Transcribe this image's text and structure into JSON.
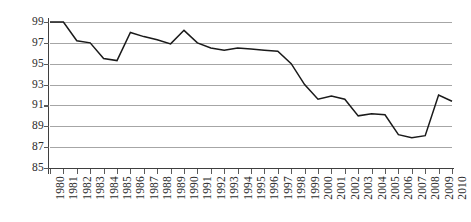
{
  "chart_data": {
    "type": "line",
    "title": "",
    "subtitle": "",
    "xlabel": "",
    "ylabel": "",
    "grid": "horizontal",
    "legend": "none",
    "ylim": [
      85,
      99
    ],
    "y_ticks": [
      85,
      87,
      89,
      91,
      93,
      95,
      97,
      99
    ],
    "y_tick_labels": [
      "85",
      "87",
      "89",
      "91",
      "93",
      "95",
      "97",
      "99"
    ],
    "x_tick_rotation": -90,
    "categories": [
      "1980",
      "1981",
      "1982",
      "1983",
      "1984",
      "1985",
      "1986",
      "1987",
      "1988",
      "1989",
      "1990",
      "1991",
      "1992",
      "1993",
      "1994",
      "1995",
      "1996",
      "1997",
      "1998",
      "1999",
      "2000",
      "2001",
      "2002",
      "2003",
      "2004",
      "2005",
      "2006",
      "2007",
      "2008",
      "2009",
      "2010"
    ],
    "series": [
      {
        "name": "series-1",
        "color": "#1a1a1a",
        "values": [
          99.0,
          99.0,
          97.2,
          97.0,
          95.5,
          95.3,
          98.0,
          97.6,
          97.3,
          96.9,
          98.2,
          97.0,
          96.5,
          96.3,
          96.5,
          96.4,
          96.3,
          96.2,
          95.0,
          93.0,
          91.6,
          91.9,
          91.6,
          90.0,
          90.2,
          90.1,
          88.2,
          87.9,
          88.1,
          92.0,
          91.4
        ]
      }
    ],
    "colors": {
      "line": "#1a1a1a",
      "gridline": "#a6a6a6",
      "axis": "#3f3f3f",
      "tick_label": "#2b2b2b",
      "background": "#ffffff"
    }
  }
}
